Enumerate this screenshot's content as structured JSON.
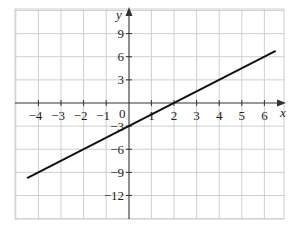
{
  "chart_data": {
    "type": "line",
    "title": "",
    "xlabel": "x",
    "ylabel": "y",
    "xlim": [
      -5,
      6.9
    ],
    "ylim": [
      -15,
      12
    ],
    "grid": true,
    "x_ticks": [
      -4,
      -3,
      -2,
      -1,
      1,
      2,
      3,
      4,
      5,
      6
    ],
    "y_ticks": [
      9,
      6,
      3,
      -3,
      -6,
      -9,
      -12
    ],
    "origin_label": "0",
    "x_grid_step": 1,
    "y_grid_step": 3,
    "series": [
      {
        "name": "y = 1.5x - 3",
        "x": [
          -4.5,
          6.5
        ],
        "y": [
          -9.75,
          6.75
        ],
        "color": "#111111"
      }
    ],
    "annotations": []
  },
  "labels": {
    "x_axis": "x",
    "y_axis": "y",
    "origin": "0",
    "x_ticks": [
      "−4",
      "−3",
      "−2",
      "−1",
      "1",
      "2",
      "3",
      "4",
      "5",
      "6"
    ],
    "y_ticks": [
      "9",
      "6",
      "3",
      "−3",
      "−6",
      "−9",
      "−12"
    ]
  }
}
